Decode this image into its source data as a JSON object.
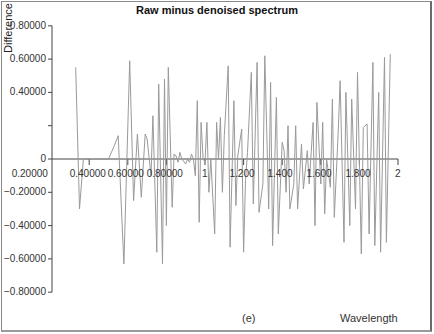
{
  "chart_data": {
    "type": "line",
    "title": "Raw minus denoised spectrum",
    "xlabel": "Wavelength",
    "ylabel": "Difference",
    "panel_label": "(e)",
    "ylim": [
      -0.8,
      0.8
    ],
    "xlim": [
      0.2,
      2.0
    ],
    "y_ticks": [
      "0.80000",
      "0.60000",
      "0.40000",
      "0.20000",
      "0",
      "−0.20000",
      "−0.40000",
      "−0.60000",
      "−0.80000"
    ],
    "x_ticks": [
      "0.20000",
      "0.40000",
      "0.60000",
      "0.80000",
      "1",
      "1.200",
      "1.400",
      "1.600",
      "1.800",
      "2"
    ],
    "grid": false,
    "legend": null,
    "series": [
      {
        "name": "Difference",
        "color": "#9a9a9a",
        "x": [
          0.33,
          0.35,
          0.37,
          0.39,
          0.41,
          0.45,
          0.47,
          0.5,
          0.53,
          0.55,
          0.58,
          0.61,
          0.63,
          0.65,
          0.67,
          0.69,
          0.7,
          0.72,
          0.73,
          0.75,
          0.76,
          0.78,
          0.79,
          0.8,
          0.81,
          0.83,
          0.84,
          0.85,
          0.86,
          0.87,
          0.88,
          0.9,
          0.91,
          0.92,
          0.93,
          0.94,
          0.95,
          0.96,
          0.97,
          0.98,
          0.99,
          1.0,
          1.01,
          1.02,
          1.03,
          1.05,
          1.06,
          1.07,
          1.08,
          1.09,
          1.1,
          1.12,
          1.13,
          1.15,
          1.16,
          1.17,
          1.19,
          1.2,
          1.21,
          1.22,
          1.24,
          1.25,
          1.27,
          1.28,
          1.3,
          1.31,
          1.33,
          1.34,
          1.35,
          1.37,
          1.38,
          1.4,
          1.41,
          1.42,
          1.43,
          1.44,
          1.46,
          1.47,
          1.48,
          1.5,
          1.51,
          1.53,
          1.54,
          1.56,
          1.57,
          1.58,
          1.6,
          1.61,
          1.62,
          1.63,
          1.65,
          1.66,
          1.67,
          1.69,
          1.7,
          1.72,
          1.73,
          1.75,
          1.76,
          1.78,
          1.79,
          1.81,
          1.82,
          1.84,
          1.85,
          1.87,
          1.88,
          1.9,
          1.91,
          1.93,
          1.94,
          1.96
        ],
        "y": [
          0.55,
          -0.3,
          0.0,
          0.0,
          0.0,
          0.0,
          0.0,
          0.0,
          0.08,
          0.14,
          -0.63,
          0.59,
          -0.25,
          0.15,
          -0.23,
          0.15,
          0.12,
          -0.1,
          0.26,
          -0.56,
          0.45,
          -0.63,
          0.48,
          -0.4,
          0.55,
          -0.29,
          0.03,
          0.02,
          -0.02,
          0.04,
          0.0,
          -0.03,
          0.0,
          -0.02,
          0.03,
          0.0,
          -0.1,
          0.35,
          -0.38,
          0.22,
          0.0,
          -0.02,
          0.22,
          -0.2,
          0.0,
          -0.45,
          0.22,
          0.0,
          0.25,
          -0.2,
          0.14,
          0.56,
          -0.53,
          0.35,
          -0.28,
          0.02,
          0.18,
          -0.56,
          -0.13,
          0.04,
          0.52,
          -0.27,
          0.58,
          -0.32,
          -0.15,
          0.62,
          -0.3,
          0.46,
          -0.52,
          0.37,
          -0.45,
          0.1,
          0.05,
          -0.2,
          0.2,
          -0.3,
          -0.15,
          0.2,
          -0.3,
          0.09,
          -0.18,
          0.05,
          -0.15,
          0.22,
          -0.4,
          0.34,
          -0.15,
          0.22,
          -0.33,
          0.0,
          -0.17,
          0.36,
          -0.35,
          0.16,
          0.47,
          -0.5,
          0.4,
          -0.4,
          0.36,
          -0.3,
          0.52,
          -0.57,
          0.19,
          0.21,
          -0.45,
          0.58,
          -0.52,
          0.4,
          -0.56,
          0.61,
          -0.5,
          0.63
        ]
      }
    ]
  }
}
